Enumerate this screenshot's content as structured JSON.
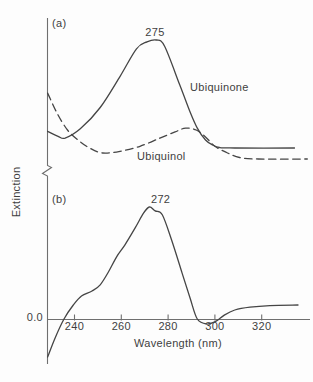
{
  "chart_data": [
    {
      "type": "line",
      "panel_label": "(a)",
      "ylabel": "Extinction",
      "y_units": "relative extinction, arbitrary units (no numeric scale shown), normalized 0-100",
      "y_axis_break": true,
      "grid": false,
      "x_range_nm": [
        228.5,
        340
      ],
      "x_ticks_nm": [
        240,
        260,
        280,
        300,
        320
      ],
      "series": [
        {
          "name": "Ubiquinone",
          "line_style": "solid",
          "peak_annotation": "275",
          "peak_nm": 275,
          "points_nm_value": [
            [
              228.5,
              27
            ],
            [
              233,
              23
            ],
            [
              236,
              21.5
            ],
            [
              242.5,
              29
            ],
            [
              251,
              46
            ],
            [
              259.5,
              71
            ],
            [
              266.5,
              93
            ],
            [
              271,
              98.5
            ],
            [
              275,
              100
            ],
            [
              278.5,
              95
            ],
            [
              285,
              64
            ],
            [
              289.5,
              42
            ],
            [
              292.5,
              29.5
            ],
            [
              296,
              20
            ],
            [
              299,
              16
            ],
            [
              302,
              14
            ],
            [
              308.5,
              13.6
            ],
            [
              334,
              13.6
            ]
          ]
        },
        {
          "name": "Ubiquinol",
          "line_style": "dashed",
          "points_nm_value": [
            [
              228.5,
              57.5
            ],
            [
              232.5,
              41.5
            ],
            [
              237,
              28
            ],
            [
              241.5,
              20
            ],
            [
              246.5,
              13.5
            ],
            [
              252,
              9.6
            ],
            [
              259.5,
              11
            ],
            [
              268,
              15
            ],
            [
              276.5,
              21.5
            ],
            [
              283,
              26.5
            ],
            [
              287.5,
              29.5
            ],
            [
              292,
              28
            ],
            [
              296,
              22.5
            ],
            [
              300,
              15
            ],
            [
              305,
              10
            ],
            [
              310.5,
              6
            ],
            [
              318.5,
              4.8
            ],
            [
              339.5,
              4.8
            ]
          ]
        }
      ]
    },
    {
      "type": "line",
      "panel_label": "(b)",
      "xlabel": "Wavelength (nm)",
      "zero_label": "0.0",
      "y_units": "relative extinction, arbitrary units; zero baseline shown, peak normalized to 100",
      "grid": false,
      "x_range_nm": [
        228.5,
        340
      ],
      "x_ticks_nm": [
        240,
        260,
        280,
        300,
        320
      ],
      "series": [
        {
          "line_style": "solid",
          "peak_annotation": "272",
          "peak_nm": 272,
          "points_nm_value": [
            [
              228.5,
              -34
            ],
            [
              231.5,
              -18
            ],
            [
              235.5,
              0
            ],
            [
              239.5,
              12.5
            ],
            [
              243,
              20.5
            ],
            [
              247.5,
              25
            ],
            [
              251,
              30.5
            ],
            [
              254.5,
              42
            ],
            [
              258,
              55.5
            ],
            [
              261.5,
              66
            ],
            [
              266,
              81.5
            ],
            [
              269.5,
              94.5
            ],
            [
              272,
              100
            ],
            [
              274.5,
              96.5
            ],
            [
              277.5,
              93
            ],
            [
              281.5,
              70.5
            ],
            [
              286,
              41
            ],
            [
              289.5,
              18
            ],
            [
              292.5,
              0
            ],
            [
              296.5,
              -4.5
            ],
            [
              300.5,
              -2
            ],
            [
              304,
              3.5
            ],
            [
              308.5,
              8
            ],
            [
              315,
              10.5
            ],
            [
              323.5,
              12
            ],
            [
              335.5,
              12.5
            ]
          ]
        }
      ]
    }
  ],
  "colors": {
    "curve": "#454545",
    "axis": "#6f6f6f",
    "text": "#3f3f3f",
    "background": "#fdfdfd"
  }
}
